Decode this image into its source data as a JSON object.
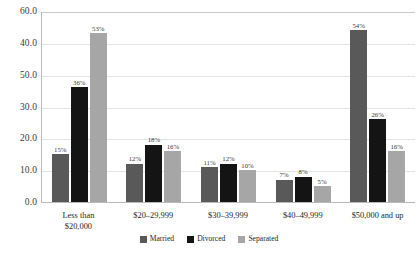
{
  "chart_data": {
    "type": "bar",
    "title": "",
    "subtitle": "",
    "xlabel": "",
    "ylabel": "",
    "grid": true,
    "legend_position": "bottom-right",
    "ylim": [
      0,
      60
    ],
    "categories": [
      "Less than\n$20,000",
      "$20–29,999",
      "$30–39,999",
      "$40–49,999",
      "$50,000 and up"
    ],
    "ytick_labels": [
      "60.0",
      "40.0",
      "50.0",
      "30.0",
      "20.0",
      "10.0",
      "0.0"
    ],
    "ytick_values": [
      60,
      50,
      40,
      30,
      20,
      10,
      0
    ],
    "series": [
      {
        "name": "Married",
        "color": "#595959",
        "values": [
          15,
          12,
          11,
          7,
          54
        ],
        "data_labels": [
          "15%",
          "12%",
          "11%",
          "7%",
          "54%"
        ]
      },
      {
        "name": "Divorced",
        "color": "#141414",
        "values": [
          36,
          18,
          12,
          8,
          26
        ],
        "data_labels": [
          "36%",
          "18%",
          "12%",
          "8%",
          "26%"
        ]
      },
      {
        "name": "Separated",
        "color": "#a6a6a6",
        "values": [
          53,
          16,
          10,
          5,
          16
        ],
        "data_labels": [
          "53%",
          "16%",
          "10%",
          "5%",
          "16%"
        ]
      }
    ]
  }
}
